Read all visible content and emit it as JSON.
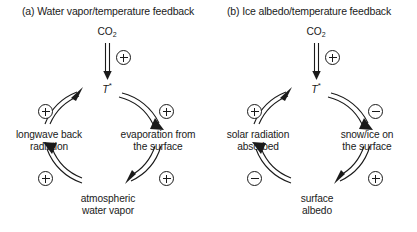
{
  "figure": {
    "background": "#ffffff",
    "stroke_color": "#1a1a1a",
    "text_color": "#1a1a1a"
  },
  "panels": [
    {
      "id": "a",
      "title": "(a) Water vapor/temperature feedback",
      "forcing": {
        "label": "CO",
        "subscript": "2",
        "arrow_sign": "+",
        "arrow_sign_name": "plus"
      },
      "center_node": {
        "label": "T",
        "superscript": "*"
      },
      "nodes": [
        {
          "id": "evaporation",
          "label": "evaporation from\nthe surface",
          "position": "right"
        },
        {
          "id": "water-vapor",
          "label": "atmospheric\nwater vapor",
          "position": "bottom"
        },
        {
          "id": "longwave",
          "label": "longwave back\nradiation",
          "position": "left"
        }
      ],
      "links": [
        {
          "from": "T*",
          "to": "evaporation",
          "sign": "+",
          "sign_name": "plus",
          "quadrant": "upper-right"
        },
        {
          "from": "evaporation",
          "to": "water-vapor",
          "sign": "+",
          "sign_name": "plus",
          "quadrant": "lower-right"
        },
        {
          "from": "water-vapor",
          "to": "longwave",
          "sign": "+",
          "sign_name": "plus",
          "quadrant": "lower-left"
        },
        {
          "from": "longwave",
          "to": "T*",
          "sign": "+",
          "sign_name": "plus",
          "quadrant": "upper-left"
        }
      ]
    },
    {
      "id": "b",
      "title": "(b) Ice albedo/temperature feedback",
      "forcing": {
        "label": "CO",
        "subscript": "2",
        "arrow_sign": "+",
        "arrow_sign_name": "plus"
      },
      "center_node": {
        "label": "T",
        "superscript": "*"
      },
      "nodes": [
        {
          "id": "snow-ice",
          "label": "snow/ice on\nthe surface",
          "position": "right"
        },
        {
          "id": "surface-albedo",
          "label": "surface\nalbedo",
          "position": "bottom"
        },
        {
          "id": "solar-absorbed",
          "label": "solar radiation\nabsorbed",
          "position": "left"
        }
      ],
      "links": [
        {
          "from": "T*",
          "to": "snow-ice",
          "sign": "−",
          "sign_name": "minus",
          "quadrant": "upper-right"
        },
        {
          "from": "snow-ice",
          "to": "surface-albedo",
          "sign": "+",
          "sign_name": "plus",
          "quadrant": "lower-right"
        },
        {
          "from": "surface-albedo",
          "to": "solar-absorbed",
          "sign": "−",
          "sign_name": "minus",
          "quadrant": "lower-left"
        },
        {
          "from": "solar-absorbed",
          "to": "T*",
          "sign": "+",
          "sign_name": "plus",
          "quadrant": "upper-left"
        }
      ]
    }
  ]
}
